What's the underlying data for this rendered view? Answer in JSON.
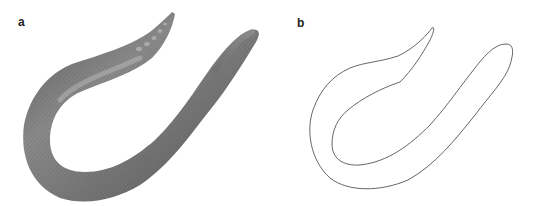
{
  "figure": {
    "panels": [
      {
        "label": "a",
        "content": "photograph of an earthworm (annelid) curved in a U shape",
        "colors": {
          "body_dark": "#4a4a4a",
          "body_mid": "#7a7a7a",
          "body_light": "#a8a8a8",
          "segment_lines": "#5a5a5a"
        }
      },
      {
        "label": "b",
        "content": "line-drawing outline of the same earthworm body shape",
        "colors": {
          "stroke": "#555555",
          "fill": "#ffffff"
        }
      }
    ]
  }
}
